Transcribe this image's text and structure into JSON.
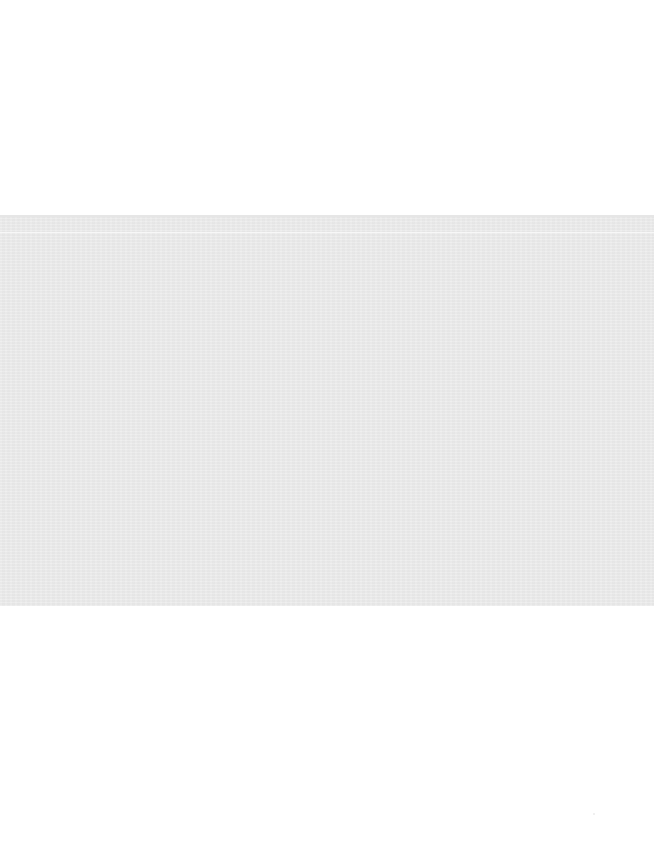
{
  "page": {
    "background_color": "#ffffff",
    "band": {
      "color": "#ececec",
      "top": 215,
      "height": 391
    },
    "text": []
  }
}
